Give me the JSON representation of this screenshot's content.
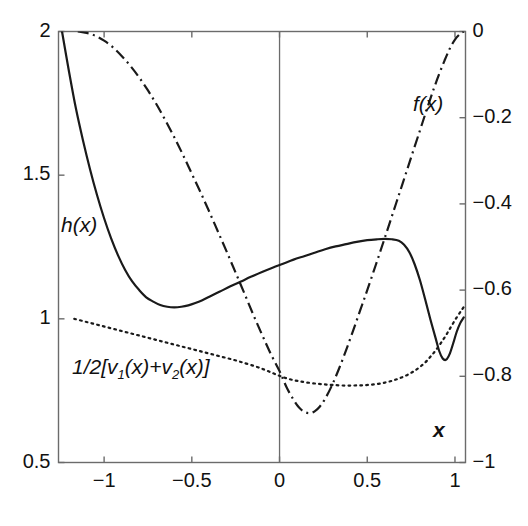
{
  "figure": {
    "background": "#ffffff",
    "frame_color": "#6b6b6b",
    "curve_color": "#1a1a1a",
    "width": 528,
    "height": 526
  },
  "axes": {
    "left": {
      "label": "",
      "min": 0.5,
      "max": 2.0,
      "ticks": [
        {
          "value": 2.0,
          "label": "2"
        },
        {
          "value": 1.5,
          "label": "1.5"
        },
        {
          "value": 1.0,
          "label": "1"
        },
        {
          "value": 0.5,
          "label": "0.5"
        }
      ]
    },
    "right": {
      "label": "",
      "min": -1.0,
      "max": 0.0,
      "ticks": [
        {
          "value": 0.0,
          "label": "0"
        },
        {
          "value": -0.2,
          "label": "−0.2"
        },
        {
          "value": -0.4,
          "label": "−0.4"
        },
        {
          "value": -0.6,
          "label": "−0.6"
        },
        {
          "value": -0.8,
          "label": "−0.8"
        },
        {
          "value": -1.0,
          "label": "−1"
        }
      ]
    },
    "bottom": {
      "label": "x",
      "min": -1.26,
      "max": 1.06,
      "ticks": [
        {
          "value": -1.0,
          "label": "−1"
        },
        {
          "value": -0.5,
          "label": "−0.5"
        },
        {
          "value": 0.0,
          "label": "0"
        },
        {
          "value": 0.5,
          "label": "0.5"
        },
        {
          "value": 1.0,
          "label": "1"
        }
      ]
    }
  },
  "annotations": {
    "h_label": "h(x)",
    "f_label": "f(x)",
    "v_label_pre": "1/2[v",
    "v_label_sub1": "1",
    "v_label_mid": "(x)+v",
    "v_label_sub2": "2",
    "v_label_post": "(x)]",
    "x_axis_label": "x"
  },
  "chart_data": {
    "type": "line",
    "title": "",
    "xlabel": "x",
    "ylabel": "",
    "xlim": [
      -1.26,
      1.06
    ],
    "ylim": [
      0.5,
      2.0
    ],
    "ylim_right": [
      -1.0,
      0.0
    ],
    "grid": false,
    "legend": "inline-annotations",
    "vertical_reference_line_x": 0.0,
    "series": [
      {
        "name": "h(x)",
        "style": "solid",
        "axis": "left",
        "points": [
          [
            -1.24,
            2.0
          ],
          [
            -1.2,
            1.86
          ],
          [
            -1.16,
            1.73
          ],
          [
            -1.12,
            1.62
          ],
          [
            -1.08,
            1.52
          ],
          [
            -1.04,
            1.43
          ],
          [
            -1.0,
            1.35
          ],
          [
            -0.96,
            1.28
          ],
          [
            -0.92,
            1.22
          ],
          [
            -0.88,
            1.17
          ],
          [
            -0.84,
            1.13
          ],
          [
            -0.8,
            1.1
          ],
          [
            -0.76,
            1.075
          ],
          [
            -0.72,
            1.06
          ],
          [
            -0.68,
            1.048
          ],
          [
            -0.64,
            1.042
          ],
          [
            -0.6,
            1.04
          ],
          [
            -0.56,
            1.042
          ],
          [
            -0.52,
            1.047
          ],
          [
            -0.48,
            1.055
          ],
          [
            -0.44,
            1.065
          ],
          [
            -0.4,
            1.077
          ],
          [
            -0.34,
            1.095
          ],
          [
            -0.28,
            1.113
          ],
          [
            -0.22,
            1.13
          ],
          [
            -0.16,
            1.147
          ],
          [
            -0.1,
            1.163
          ],
          [
            -0.04,
            1.178
          ],
          [
            0.02,
            1.192
          ],
          [
            0.08,
            1.206
          ],
          [
            0.14,
            1.218
          ],
          [
            0.2,
            1.23
          ],
          [
            0.26,
            1.242
          ],
          [
            0.32,
            1.252
          ],
          [
            0.38,
            1.26
          ],
          [
            0.44,
            1.268
          ],
          [
            0.5,
            1.274
          ],
          [
            0.56,
            1.277
          ],
          [
            0.6,
            1.278
          ],
          [
            0.64,
            1.277
          ],
          [
            0.68,
            1.272
          ],
          [
            0.71,
            1.258
          ],
          [
            0.74,
            1.232
          ],
          [
            0.77,
            1.19
          ],
          [
            0.8,
            1.135
          ],
          [
            0.83,
            1.068
          ],
          [
            0.86,
            0.998
          ],
          [
            0.89,
            0.932
          ],
          [
            0.91,
            0.888
          ],
          [
            0.93,
            0.862
          ],
          [
            0.95,
            0.858
          ],
          [
            0.97,
            0.878
          ],
          [
            0.99,
            0.915
          ],
          [
            1.01,
            0.955
          ],
          [
            1.03,
            0.985
          ],
          [
            1.05,
            1.005
          ]
        ]
      },
      {
        "name": "f(x)",
        "style": "dash-dot",
        "axis": "left",
        "points": [
          [
            -1.15,
            2.0
          ],
          [
            -1.1,
            1.995
          ],
          [
            -1.05,
            1.985
          ],
          [
            -1.0,
            1.968
          ],
          [
            -0.95,
            1.945
          ],
          [
            -0.9,
            1.915
          ],
          [
            -0.85,
            1.88
          ],
          [
            -0.8,
            1.84
          ],
          [
            -0.75,
            1.795
          ],
          [
            -0.7,
            1.745
          ],
          [
            -0.65,
            1.69
          ],
          [
            -0.6,
            1.632
          ],
          [
            -0.55,
            1.57
          ],
          [
            -0.5,
            1.505
          ],
          [
            -0.45,
            1.44
          ],
          [
            -0.4,
            1.372
          ],
          [
            -0.35,
            1.302
          ],
          [
            -0.3,
            1.232
          ],
          [
            -0.25,
            1.16
          ],
          [
            -0.2,
            1.088
          ],
          [
            -0.15,
            1.015
          ],
          [
            -0.1,
            0.945
          ],
          [
            -0.05,
            0.878
          ],
          [
            0.0,
            0.818
          ],
          [
            0.04,
            0.762
          ],
          [
            0.08,
            0.718
          ],
          [
            0.11,
            0.692
          ],
          [
            0.14,
            0.677
          ],
          [
            0.17,
            0.672
          ],
          [
            0.2,
            0.678
          ],
          [
            0.23,
            0.695
          ],
          [
            0.26,
            0.722
          ],
          [
            0.3,
            0.77
          ],
          [
            0.34,
            0.828
          ],
          [
            0.38,
            0.892
          ],
          [
            0.42,
            0.96
          ],
          [
            0.46,
            1.03
          ],
          [
            0.5,
            1.1
          ],
          [
            0.55,
            1.19
          ],
          [
            0.6,
            1.282
          ],
          [
            0.65,
            1.375
          ],
          [
            0.7,
            1.468
          ],
          [
            0.75,
            1.562
          ],
          [
            0.8,
            1.655
          ],
          [
            0.84,
            1.73
          ],
          [
            0.88,
            1.802
          ],
          [
            0.91,
            1.852
          ],
          [
            0.94,
            1.898
          ],
          [
            0.97,
            1.94
          ],
          [
            1.0,
            1.972
          ],
          [
            1.03,
            1.992
          ],
          [
            1.05,
            2.0
          ]
        ]
      },
      {
        "name": "1/2[v1(x)+v2(x)]",
        "style": "dotted",
        "axis": "left",
        "points": [
          [
            -1.17,
            1.0
          ],
          [
            -1.1,
            0.989
          ],
          [
            -1.03,
            0.978
          ],
          [
            -0.96,
            0.967
          ],
          [
            -0.89,
            0.956
          ],
          [
            -0.82,
            0.945
          ],
          [
            -0.75,
            0.934
          ],
          [
            -0.68,
            0.923
          ],
          [
            -0.61,
            0.912
          ],
          [
            -0.54,
            0.901
          ],
          [
            -0.47,
            0.89
          ],
          [
            -0.4,
            0.879
          ],
          [
            -0.33,
            0.868
          ],
          [
            -0.26,
            0.857
          ],
          [
            -0.2,
            0.846
          ],
          [
            -0.14,
            0.835
          ],
          [
            -0.09,
            0.824
          ],
          [
            -0.05,
            0.814
          ],
          [
            -0.01,
            0.804
          ],
          [
            0.03,
            0.795
          ],
          [
            0.07,
            0.788
          ],
          [
            0.11,
            0.783
          ],
          [
            0.15,
            0.779
          ],
          [
            0.2,
            0.775
          ],
          [
            0.25,
            0.772
          ],
          [
            0.3,
            0.77
          ],
          [
            0.36,
            0.768
          ],
          [
            0.42,
            0.768
          ],
          [
            0.48,
            0.769
          ],
          [
            0.54,
            0.772
          ],
          [
            0.6,
            0.778
          ],
          [
            0.65,
            0.786
          ],
          [
            0.7,
            0.797
          ],
          [
            0.75,
            0.812
          ],
          [
            0.79,
            0.828
          ],
          [
            0.83,
            0.848
          ],
          [
            0.86,
            0.868
          ],
          [
            0.89,
            0.89
          ],
          [
            0.92,
            0.916
          ],
          [
            0.95,
            0.944
          ],
          [
            0.98,
            0.975
          ],
          [
            1.01,
            1.005
          ],
          [
            1.04,
            1.032
          ],
          [
            1.06,
            1.05
          ]
        ]
      }
    ]
  }
}
